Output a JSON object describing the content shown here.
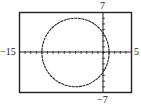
{
  "chart_data": {
    "type": "line",
    "title": "",
    "xlabel": "",
    "ylabel": "",
    "xlim": [
      -15,
      5
    ],
    "ylim": [
      -7,
      7
    ],
    "grid": false,
    "tick_marks": "unit ticks along both axes",
    "series": [
      {
        "name": "circle",
        "shape": "circle",
        "center": [
          -5,
          0
        ],
        "radius": 6,
        "style": "dashed/dotted calculator trace"
      }
    ],
    "window_labels": {
      "xmin": "−15",
      "xmax": "5",
      "ymax": "7",
      "ymin": "−7"
    }
  }
}
